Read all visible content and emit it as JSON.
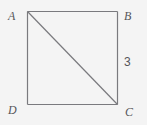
{
  "figure": {
    "type": "geometry-diagram",
    "shape": "square",
    "background_color": "#f4f4f4",
    "stroke_color": "#7a7a7e",
    "label_color": "#56565a",
    "vertices": {
      "A": {
        "label": "A",
        "position": "top-left"
      },
      "B": {
        "label": "B",
        "position": "top-right"
      },
      "C": {
        "label": "C",
        "position": "bottom-right"
      },
      "D": {
        "label": "D",
        "position": "bottom-left"
      }
    },
    "sides": [
      {
        "name": "AB",
        "from": "A",
        "to": "B"
      },
      {
        "name": "BC",
        "from": "B",
        "to": "C",
        "measure": "3"
      },
      {
        "name": "CD",
        "from": "C",
        "to": "D"
      },
      {
        "name": "DA",
        "from": "D",
        "to": "A"
      }
    ],
    "diagonals": [
      {
        "name": "AC",
        "from": "A",
        "to": "C"
      }
    ],
    "measures": {
      "side_bc": "3"
    }
  }
}
